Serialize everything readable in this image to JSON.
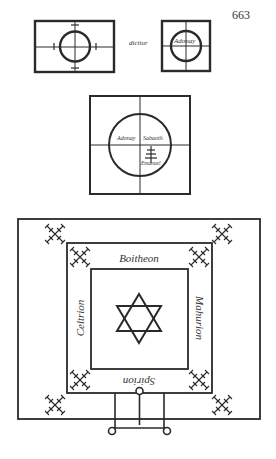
{
  "page": {
    "number": "663"
  },
  "figure_top": {
    "connector_word": "dicitur",
    "right_label": "Adonay"
  },
  "figure_middle": {
    "labels": {
      "top_left": "Adonay",
      "top_right": "Sabaoth",
      "bottom_right": "Emanuel"
    },
    "symbol": "tree-cross-glyph"
  },
  "figure_bottom": {
    "labels": {
      "top": "Boitheon",
      "left": "Celtrion",
      "right": "Mahurion",
      "bottom": "Spirion"
    },
    "center_symbol": "hexagram",
    "corner_symbol": "cross-of-crosses"
  },
  "colors": {
    "ink": "#2a2a2a",
    "paper": "#ffffff"
  }
}
